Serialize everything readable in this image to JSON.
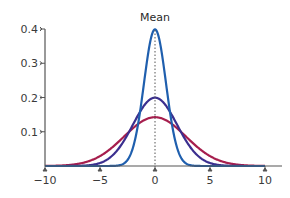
{
  "chart_data": {
    "type": "line",
    "title": "",
    "annotation": "Mean",
    "xlabel": "",
    "ylabel": "",
    "xlim": [
      -10,
      10
    ],
    "ylim": [
      0,
      0.4
    ],
    "x_ticks": [
      -10,
      -5,
      0,
      5,
      10
    ],
    "x_tick_labels": [
      "−10",
      "−5",
      "0",
      "5",
      "10"
    ],
    "y_ticks": [
      0.1,
      0.2,
      0.3,
      0.4
    ],
    "y_tick_labels": [
      "0.1",
      "0.2",
      "0.3",
      "0.4"
    ],
    "grid": false,
    "legend": null,
    "mean_line_x": 0,
    "series": [
      {
        "name": "Normal (σ≈2.8)",
        "mean": 0,
        "sd": 2.8,
        "peak": 0.14,
        "color": "#a61e4d"
      },
      {
        "name": "Normal (σ=2)",
        "mean": 0,
        "sd": 2.0,
        "peak": 0.2,
        "color": "#3b2f8f"
      },
      {
        "name": "Normal (σ=1)",
        "mean": 0,
        "sd": 1.0,
        "peak": 0.4,
        "color": "#1f5fae"
      }
    ],
    "x": [
      -10,
      -8,
      -6,
      -4,
      -3,
      -2,
      -1,
      0,
      1,
      2,
      3,
      4,
      6,
      8,
      10
    ],
    "values_by_series": {
      "Normal (σ≈2.8)": [
        0.0003,
        0.0026,
        0.0142,
        0.0514,
        0.0804,
        0.1095,
        0.1333,
        0.1425,
        0.1333,
        0.1095,
        0.0804,
        0.0514,
        0.0142,
        0.0026,
        0.0003
      ],
      "Normal (σ=2)": [
        0.0,
        0.0001,
        0.0022,
        0.027,
        0.0648,
        0.121,
        0.176,
        0.1995,
        0.176,
        0.121,
        0.0648,
        0.027,
        0.0022,
        0.0001,
        0.0
      ],
      "Normal (σ=1)": [
        0.0,
        0.0,
        0.0,
        0.0001,
        0.0044,
        0.054,
        0.242,
        0.3989,
        0.242,
        0.054,
        0.0044,
        0.0001,
        0.0,
        0.0,
        0.0
      ]
    }
  },
  "colors": {
    "axis": "#555555",
    "mean_line": "#555555"
  }
}
